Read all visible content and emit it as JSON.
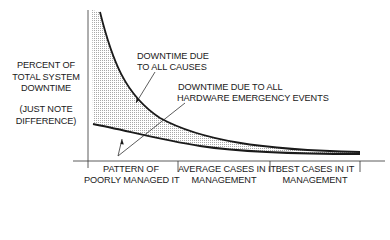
{
  "diagram": {
    "y_axis_label": [
      "PERCENT OF",
      "TOTAL SYSTEM",
      "DOWNTIME"
    ],
    "y_axis_note": [
      "(JUST NOTE",
      "DIFFERENCE)"
    ],
    "curve_all_causes_label": [
      "DOWNTIME DUE",
      "TO ALL CAUSES"
    ],
    "curve_hardware_label": [
      "DOWNTIME DUE TO ALL",
      "HARDWARE EMERGENCY EVENTS"
    ],
    "x_categories": [
      [
        "PATTERN OF",
        "POORLY MANAGED IT"
      ],
      [
        "AVERAGE CASES IN IT",
        "MANAGEMENT"
      ],
      [
        "BEST CASES IN IT",
        "MANAGEMENT"
      ]
    ],
    "colors": {
      "line": "#1a1a1a",
      "shade": "#bdbdbd",
      "background": "#ffffff"
    }
  }
}
